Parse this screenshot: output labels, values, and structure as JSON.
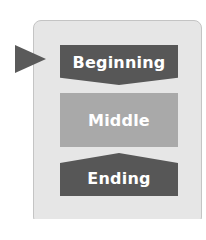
{
  "diagram": {
    "stages": [
      {
        "label": "Beginning",
        "color": "#575757"
      },
      {
        "label": "Middle",
        "color": "#a9a9a9"
      },
      {
        "label": "Ending",
        "color": "#575757"
      }
    ],
    "pointer": {
      "target": "Beginning",
      "color": "#5a5a5a"
    },
    "panel_color": "#e6e6e6"
  }
}
